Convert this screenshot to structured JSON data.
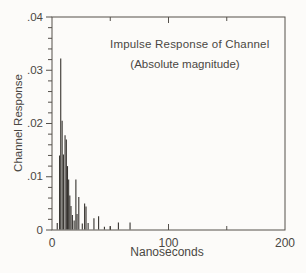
{
  "chart_data": {
    "type": "bar",
    "subtype": "impulse-stem",
    "title": "Impulse Response of Channel",
    "subtitle": "(Absolute magnitude)",
    "xlabel": "Nanoseconds",
    "ylabel": "Channel Response",
    "xlim": [
      0,
      200
    ],
    "ylim": [
      0,
      0.04
    ],
    "x_major_ticks": [
      0,
      100,
      200
    ],
    "x_major_labels": [
      "0",
      "100",
      "200"
    ],
    "x_minor_ticks": [
      50,
      150
    ],
    "y_major_ticks": [
      0,
      0.01,
      0.02,
      0.03,
      0.04
    ],
    "y_major_labels": [
      "0",
      ".01",
      ".02",
      ".03",
      ".04"
    ],
    "y_minor_step": 0.002,
    "grid": false,
    "legend": false,
    "frame": "box",
    "series": [
      {
        "name": "impulse-magnitude",
        "x": [
          4.5,
          6.5,
          7.5,
          8.7,
          9.8,
          11.2,
          12.3,
          13.3,
          14.3,
          15.3,
          16.3,
          17.5,
          19.0,
          20.5,
          21.5,
          23.0,
          26.0,
          28.0,
          29.2,
          31.0,
          36.0,
          40.0,
          45.0,
          50.0,
          57.0,
          67.0
        ],
        "values": [
          0.0013,
          0.014,
          0.0322,
          0.0205,
          0.0142,
          0.0178,
          0.017,
          0.012,
          0.0095,
          0.0065,
          0.0045,
          0.0028,
          0.0018,
          0.0095,
          0.003,
          0.0062,
          0.0012,
          0.005,
          0.0044,
          0.0013,
          0.0022,
          0.0026,
          0.0006,
          0.0007,
          0.0014,
          0.0014
        ]
      }
    ]
  },
  "colors": {
    "axis": "#54504b",
    "spike": "#35322e",
    "text": "#4a4743",
    "background": "#fcfbf9"
  }
}
